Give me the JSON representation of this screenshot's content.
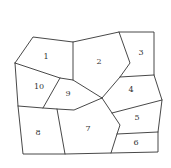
{
  "diagram": {
    "type": "region-map",
    "line_color": "#333333",
    "background": "#ffffff",
    "regions": [
      {
        "label": "1",
        "x": 46,
        "y": 57
      },
      {
        "label": "2",
        "x": 99,
        "y": 62
      },
      {
        "label": "3",
        "x": 141,
        "y": 53
      },
      {
        "label": "4",
        "x": 131,
        "y": 90
      },
      {
        "label": "5",
        "x": 137,
        "y": 118
      },
      {
        "label": "6",
        "x": 136,
        "y": 143
      },
      {
        "label": "7",
        "x": 88,
        "y": 129
      },
      {
        "label": "8",
        "x": 38,
        "y": 133
      },
      {
        "label": "9",
        "x": 68,
        "y": 94
      },
      {
        "label": "10",
        "x": 39,
        "y": 87
      }
    ]
  }
}
